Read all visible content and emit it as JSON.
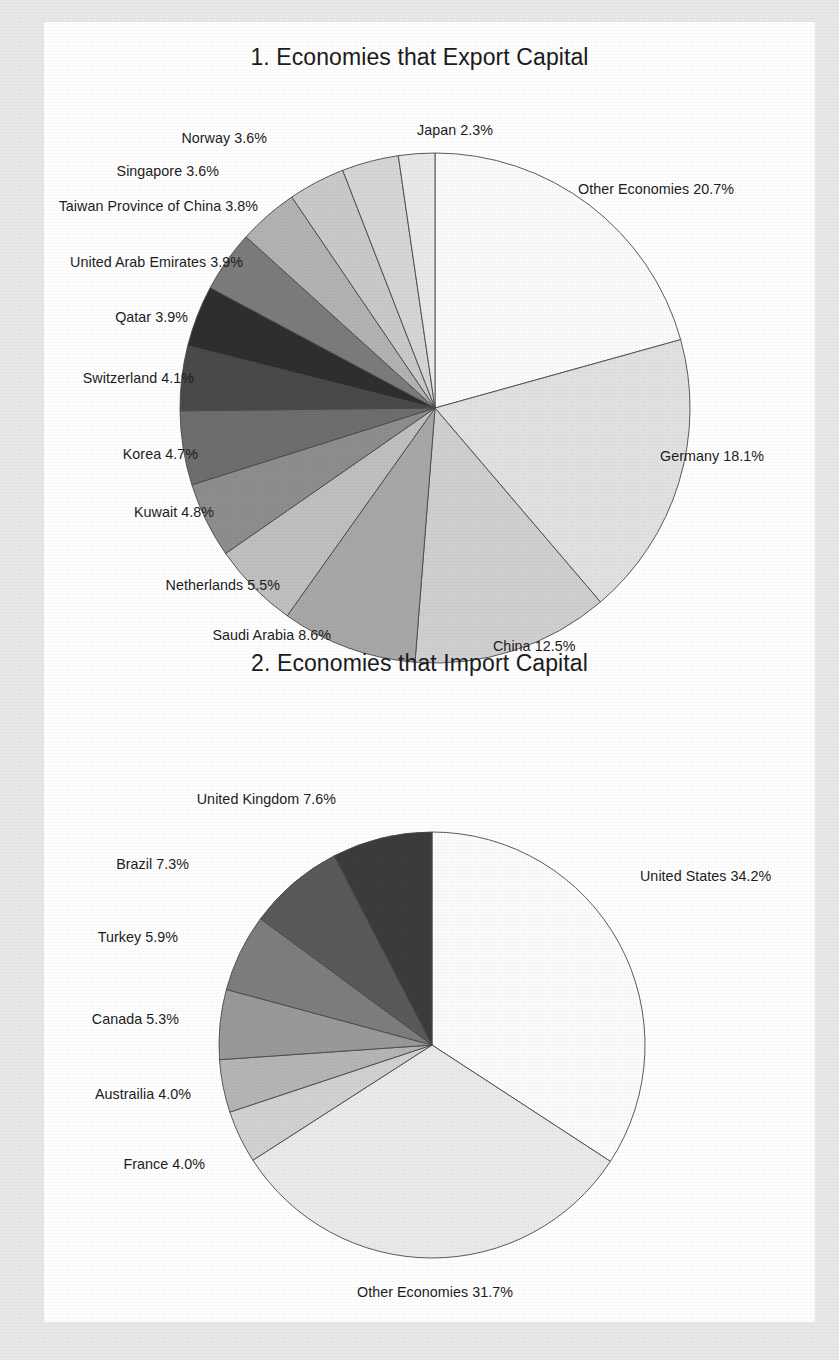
{
  "page": {
    "background_color": "#e9e9e9",
    "paper_color": "#ffffff"
  },
  "chart_data": [
    {
      "type": "pie",
      "title": "1. Economies that Export Capital",
      "index": "1",
      "unit": "%",
      "start_angle_deg": 0,
      "direction": "clockwise",
      "legend_position": "outside-labels",
      "total": 100.0,
      "categories": [
        "Other Economies",
        "Germany",
        "China",
        "Saudi Arabia",
        "Netherlands",
        "Kuwait",
        "Korea",
        "Switzerland",
        "Qatar",
        "United Arab Emirates",
        "Taiwan Province of China",
        "Singapore",
        "Norway",
        "Japan"
      ],
      "values": [
        20.7,
        18.1,
        12.5,
        8.6,
        5.5,
        4.8,
        4.7,
        4.1,
        3.9,
        3.9,
        3.8,
        3.6,
        3.6,
        2.3
      ],
      "slice_colors": [
        "#fbfbfb",
        "#e2e2e2",
        "#d0d0d0",
        "#a8a8a8",
        "#c0c0c0",
        "#8e8e8e",
        "#6e6e6e",
        "#4a4a4a",
        "#2f2f2f",
        "#7c7c7c",
        "#b3b3b3",
        "#cacaca",
        "#d6d6d6",
        "#eaeaea"
      ],
      "labels": [
        {
          "name": "Other Economies",
          "value": "20.7",
          "text": "Other Economies 20.7%"
        },
        {
          "name": "Germany",
          "value": "18.1",
          "text": "Germany 18.1%"
        },
        {
          "name": "China",
          "value": "12.5",
          "text": "China 12.5%"
        },
        {
          "name": "Saudi Arabia",
          "value": "8.6",
          "text": "Saudi Arabia 8.6%"
        },
        {
          "name": "Netherlands",
          "value": "5.5",
          "text": "Netherlands 5.5%"
        },
        {
          "name": "Kuwait",
          "value": "4.8",
          "text": "Kuwait 4.8%"
        },
        {
          "name": "Korea",
          "value": "4.7",
          "text": "Korea 4.7%"
        },
        {
          "name": "Switzerland",
          "value": "4.1",
          "text": "Switzerland 4.1%"
        },
        {
          "name": "Qatar",
          "value": "3.9",
          "text": "Qatar 3.9%"
        },
        {
          "name": "United Arab Emirates",
          "value": "3.9",
          "text": "United Arab Emirates 3.9%"
        },
        {
          "name": "Taiwan Province of China",
          "value": "3.8",
          "text": "Taiwan Province of China 3.8%"
        },
        {
          "name": "Singapore",
          "value": "3.6",
          "text": "Singapore 3.6%"
        },
        {
          "name": "Norway",
          "value": "3.6",
          "text": "Norway 3.6%"
        },
        {
          "name": "Japan",
          "value": "2.3",
          "text": "Japan 2.3%"
        }
      ]
    },
    {
      "type": "pie",
      "title": "2. Economies that Import Capital",
      "index": "2",
      "unit": "%",
      "start_angle_deg": 0,
      "direction": "clockwise",
      "legend_position": "outside-labels",
      "total": 100.0,
      "categories": [
        "United States",
        "Other Economies",
        "France",
        "Austrailia",
        "Canada",
        "Turkey",
        "Brazil",
        "United Kingdom"
      ],
      "values": [
        34.2,
        31.7,
        4.0,
        4.0,
        5.3,
        5.9,
        7.3,
        7.6
      ],
      "slice_colors": [
        "#fcfcfc",
        "#ebebeb",
        "#d2d2d2",
        "#b6b6b6",
        "#9a9a9a",
        "#7e7e7e",
        "#5a5a5a",
        "#3c3c3c"
      ],
      "labels": [
        {
          "name": "United States",
          "value": "34.2",
          "text": "United States 34.2%"
        },
        {
          "name": "Other Economies",
          "value": "31.7",
          "text": "Other Economies 31.7%"
        },
        {
          "name": "France",
          "value": "4.0",
          "text": "France 4.0%"
        },
        {
          "name": "Austrailia",
          "value": "4.0",
          "text": "Austrailia 4.0%"
        },
        {
          "name": "Canada",
          "value": "5.3",
          "text": "Canada 5.3%"
        },
        {
          "name": "Turkey",
          "value": "5.9",
          "text": "Turkey 5.9%"
        },
        {
          "name": "Brazil",
          "value": "7.3",
          "text": "Brazil 7.3%"
        },
        {
          "name": "United Kingdom",
          "value": "7.6",
          "text": "United Kingdom 7.6%"
        }
      ]
    }
  ]
}
